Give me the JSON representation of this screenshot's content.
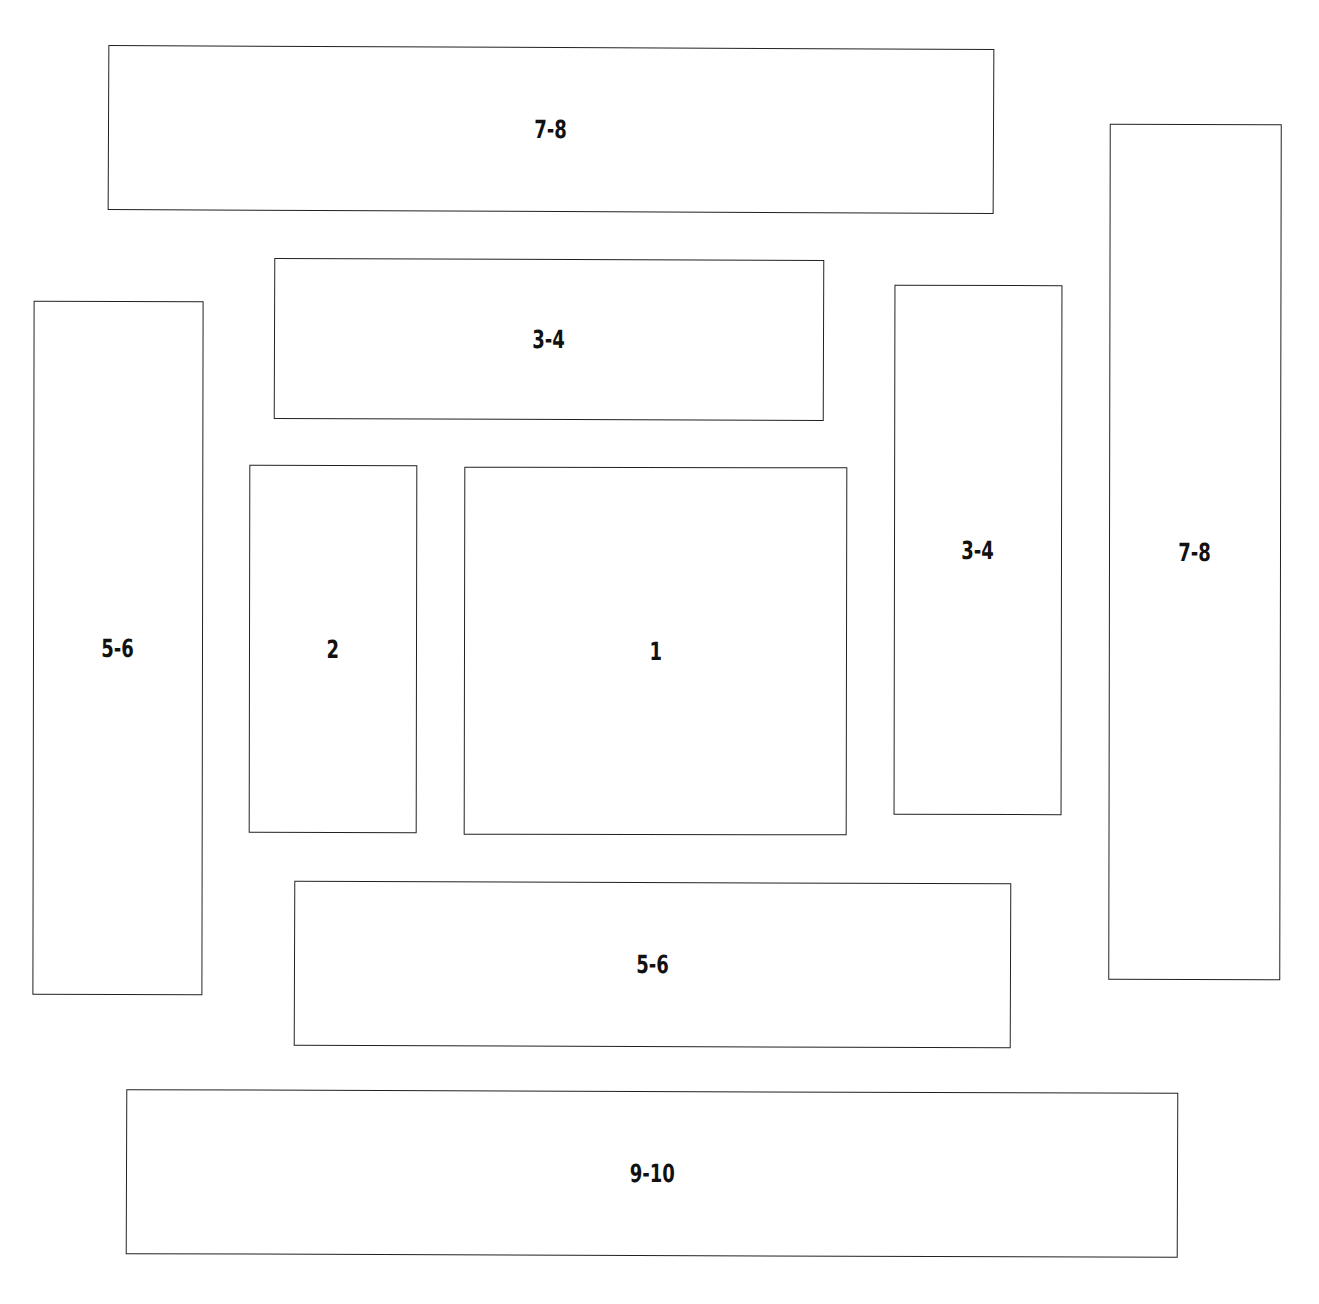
{
  "diagram": {
    "type": "log-cabin quilt block layout",
    "boxes": [
      {
        "id": "top-7-8",
        "label": "7-8",
        "x": 108,
        "y": 47,
        "w": 886,
        "h": 165,
        "rot": 0.25
      },
      {
        "id": "upper-3-4",
        "label": "3-4",
        "x": 274,
        "y": 259,
        "w": 550,
        "h": 161,
        "rot": 0.2
      },
      {
        "id": "left-5-6",
        "label": "5-6",
        "x": 33,
        "y": 301,
        "w": 170,
        "h": 694,
        "rot": 0.1
      },
      {
        "id": "center-2",
        "label": "2",
        "x": 249,
        "y": 465,
        "w": 168,
        "h": 368,
        "rot": 0.1
      },
      {
        "id": "center-1",
        "label": "1",
        "x": 464,
        "y": 467,
        "w": 383,
        "h": 368,
        "rot": 0.1
      },
      {
        "id": "right-3-4",
        "label": "3-4",
        "x": 894,
        "y": 285,
        "w": 168,
        "h": 530,
        "rot": 0.1
      },
      {
        "id": "right-7-8",
        "label": "7-8",
        "x": 1109,
        "y": 124,
        "w": 172,
        "h": 856,
        "rot": 0.1
      },
      {
        "id": "bottom-5-6",
        "label": "5-6",
        "x": 294,
        "y": 882,
        "w": 717,
        "h": 165,
        "rot": 0.2
      },
      {
        "id": "bottom-9-10",
        "label": "9-10",
        "x": 126,
        "y": 1091,
        "w": 1052,
        "h": 165,
        "rot": 0.2
      }
    ]
  }
}
